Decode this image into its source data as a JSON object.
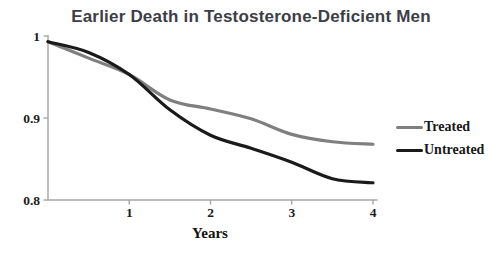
{
  "chart_data": {
    "type": "line",
    "title": "Earlier Death in Testosterone-Deficient Men",
    "xlabel": "Years",
    "ylabel": "",
    "x": [
      0,
      0.5,
      1,
      1.5,
      2,
      2.5,
      3,
      3.5,
      4
    ],
    "series": [
      {
        "name": "Treated",
        "color": "#7f7f7f",
        "values": [
          0.993,
          0.973,
          0.953,
          0.922,
          0.911,
          0.899,
          0.88,
          0.871,
          0.868
        ]
      },
      {
        "name": "Untreated",
        "color": "#1a1a1a",
        "values": [
          0.993,
          0.98,
          0.953,
          0.91,
          0.879,
          0.863,
          0.846,
          0.826,
          0.821
        ]
      }
    ],
    "xlim": [
      0,
      4
    ],
    "ylim": [
      0.8,
      1.0
    ],
    "x_ticks": [
      "1",
      "2",
      "3",
      "4"
    ],
    "y_ticks": [
      "1",
      "0.9",
      "0.8"
    ],
    "grid": false,
    "legend_position": "right",
    "line_width": 3.2,
    "axis_color": "#a6a6a6",
    "tick_label_color": "#1c1c1c",
    "title_color": "#3d3d46",
    "background": "#ffffff"
  }
}
